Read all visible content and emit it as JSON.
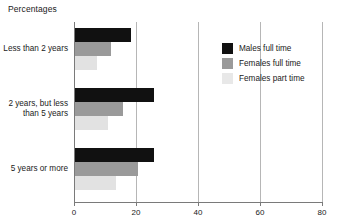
{
  "chart_data": {
    "type": "bar",
    "orientation": "horizontal",
    "title": "Percentages",
    "xlabel": "",
    "ylabel": "",
    "xlim": [
      0,
      80
    ],
    "xticks": [
      0,
      20,
      40,
      60,
      80
    ],
    "xticklabels": [
      "0",
      "20",
      "40",
      "60",
      "80"
    ],
    "grid": "vertical",
    "legend_position": "top-right",
    "categories": [
      "Less than 2 years",
      "2 years, but less than 5 years",
      "5 years or more"
    ],
    "category_lines": [
      [
        "Less than 2 years"
      ],
      [
        "2 years, but less",
        "than 5 years"
      ],
      [
        "5 years or more"
      ]
    ],
    "series": [
      {
        "name": "Males full time",
        "color": "#111111",
        "values": [
          18.0,
          25.5,
          25.5
        ]
      },
      {
        "name": "Females full time",
        "color": "#9a9a9a",
        "values": [
          11.5,
          15.5,
          20.3
        ]
      },
      {
        "name": "Females part time",
        "color": "#e2e2e2",
        "values": [
          7.0,
          10.5,
          13.2
        ]
      }
    ]
  },
  "legend": {
    "items": [
      {
        "label": "Males full time",
        "swatch": "black-swatch"
      },
      {
        "label": "Females full time",
        "swatch": "medium-gray-swatch"
      },
      {
        "label": "Females part time",
        "swatch": "light-gray-swatch"
      }
    ]
  }
}
